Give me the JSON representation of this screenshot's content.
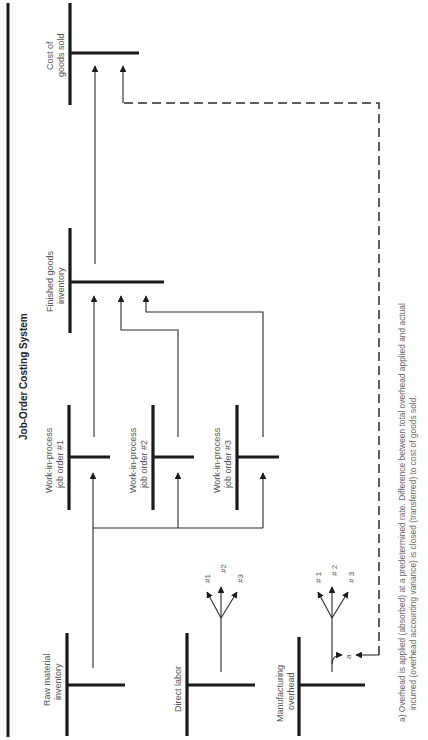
{
  "diagram": {
    "title": "Job-Order Costing System",
    "accounts": {
      "raw_material": [
        "Raw material",
        "inventory"
      ],
      "direct_labor": [
        "Direct labor"
      ],
      "mfg_overhead": [
        "Manufacturing",
        "overhead"
      ],
      "wip1": [
        "Work-in-process",
        "job order #1"
      ],
      "wip2": [
        "Work-in-process",
        "job order #2"
      ],
      "wip3": [
        "Work-in-process",
        "job order #3"
      ],
      "finished_goods": [
        "Finished goods",
        "inventory"
      ],
      "cogs": [
        "Cost of",
        "goods sold"
      ]
    },
    "labor_branches": [
      "#1",
      "#2",
      "#3"
    ],
    "overhead_branches": [
      "# 1",
      "# 2",
      "# 3"
    ],
    "footnote_marker": "a",
    "footnote": [
      "a) Overhead is applied (absorbed) at a predetermined rate.  Difference between total overhead applied and actual",
      "incurred (overhead accounting variance) is closed (transferred) to cost of goods sold."
    ],
    "colors": {
      "line": "#1a1a1a",
      "text": "#555555",
      "background": "#ffffff"
    }
  }
}
